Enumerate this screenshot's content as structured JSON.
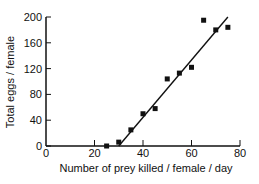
{
  "chart_data": {
    "type": "scatter",
    "title": "",
    "xlabel": "Number of prey killed / female / day",
    "ylabel": "Total eggs / female",
    "xlim": [
      0,
      80
    ],
    "ylim": [
      0,
      200
    ],
    "xticks": [
      0,
      20,
      40,
      60,
      80
    ],
    "yticks": [
      0,
      40,
      80,
      120,
      160,
      200
    ],
    "grid": false,
    "legend": null,
    "series": [
      {
        "name": "observations",
        "marker": "square",
        "points": [
          {
            "x": 25,
            "y": 0
          },
          {
            "x": 30,
            "y": 6
          },
          {
            "x": 35,
            "y": 25
          },
          {
            "x": 40,
            "y": 50
          },
          {
            "x": 45,
            "y": 58
          },
          {
            "x": 50,
            "y": 104
          },
          {
            "x": 55,
            "y": 113
          },
          {
            "x": 60,
            "y": 122
          },
          {
            "x": 65,
            "y": 195
          },
          {
            "x": 70,
            "y": 180
          },
          {
            "x": 75,
            "y": 184
          }
        ]
      },
      {
        "name": "fitted line",
        "type": "line",
        "points": [
          {
            "x": 30,
            "y": 0
          },
          {
            "x": 75,
            "y": 200
          }
        ]
      }
    ]
  }
}
